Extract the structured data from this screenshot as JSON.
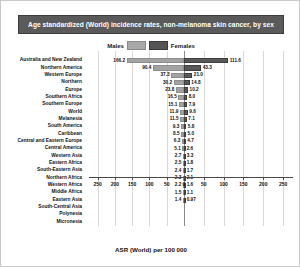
{
  "chart_data": {
    "type": "bar",
    "title": "Age standardized (World) incidence rates, non-melanoma skin cancer, by sex",
    "subtype": "diverging-horizontal-bar",
    "xlabel": "ASR (World) per 100 000",
    "ylabel": "",
    "xlim": [
      -275,
      275
    ],
    "xticks": [
      250,
      200,
      150,
      100,
      50,
      0,
      50,
      100,
      150,
      200,
      250
    ],
    "grid": true,
    "legend_position": "top-center",
    "legend": [
      "Males",
      "Females"
    ],
    "categories": [
      "Australia and New Zealand",
      "Northern America",
      "Western Europe",
      "Northern",
      "Europe",
      "Southern Africa",
      "Southern Europe",
      "World",
      "Melanesia",
      "South America",
      "Caribbean",
      "Central and Eastern Europe",
      "Central America",
      "Western Asia",
      "Eastern Africa",
      "South-Eastern Asia",
      "Northern Africa",
      "Western Africa",
      "Middle Africa",
      "Eastern Asia",
      "South-Central Asia",
      "Polynesia",
      "Micronesia"
    ],
    "series": [
      {
        "name": "Males",
        "color": "#a3a3a3",
        "values": [
          166.2,
          90.4,
          37.3,
          30.2,
          23.8,
          16.5,
          15.1,
          11.9,
          11.5,
          9.3,
          8.5,
          6.3,
          5.1,
          2.7,
          2.5,
          2.4,
          2.3,
          2.2,
          1.5,
          1.4,
          null,
          null,
          null
        ]
      },
      {
        "name": "Females",
        "color": "#585858",
        "values": [
          111.6,
          43.3,
          21.0,
          14.8,
          10.2,
          8.0,
          7.9,
          9.6,
          7.1,
          5.8,
          5.0,
          4.7,
          2.6,
          3.3,
          1.8,
          1.7,
          2.1,
          1.6,
          1.1,
          0.97,
          null,
          null,
          null
        ]
      }
    ],
    "male_labels": [
      "166.2",
      "90.4",
      "37.3",
      "30.2",
      "23.8",
      "16.5",
      "15.1",
      "11.9",
      "11.5",
      "9.3",
      "8.5",
      "6.3",
      "5.1",
      "2.7",
      "2.5",
      "2.4",
      "2.3",
      "2.2",
      "1.5",
      "1.4",
      "",
      "",
      ""
    ],
    "female_labels": [
      "111.6",
      "43.3",
      "21.0",
      "14.8",
      "10.2",
      "8.0",
      "7.9",
      "9.6",
      "7.1",
      "5.8",
      "5.0",
      "4.7",
      "2.6",
      "3.3",
      "1.8",
      "1.7",
      "2.1",
      "1.6",
      "1.1",
      "0.97",
      "",
      "",
      ""
    ]
  },
  "colors": {
    "title_bar_bg": "#5a5a5a",
    "title_text": "#ffffff",
    "males": "#a3a3a3",
    "females": "#585858",
    "grid": "#d8d8d8",
    "axis": "#4a4a4a"
  }
}
